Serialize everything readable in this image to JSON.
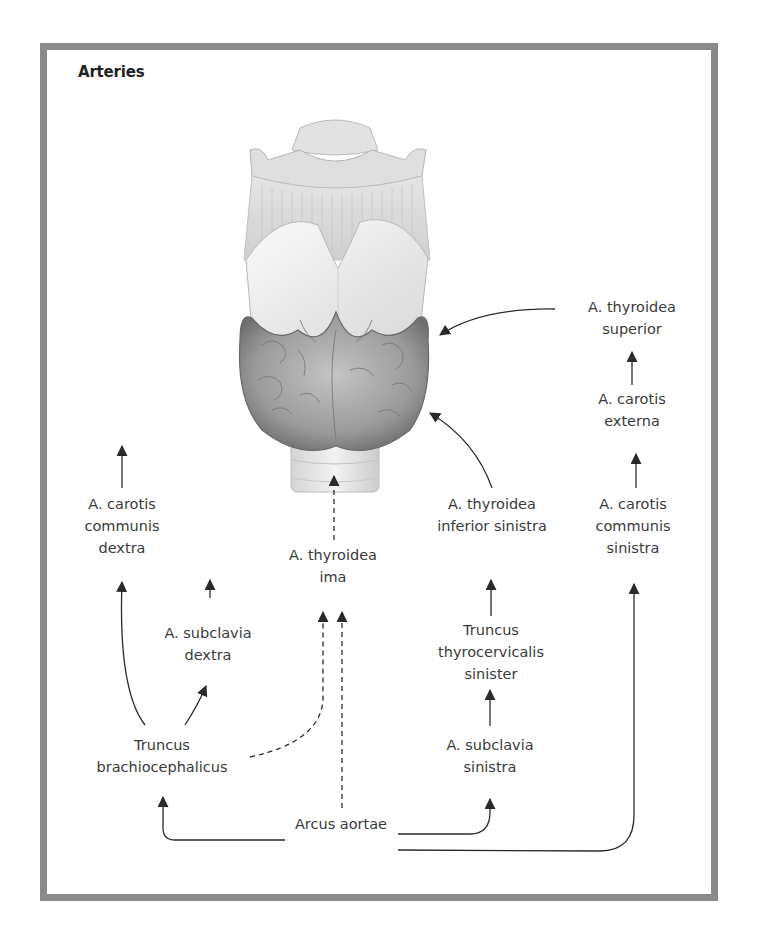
{
  "title": "Arteries",
  "colors": {
    "frame": "#8a8a8a",
    "text": "#3a3a3a",
    "arrow": "#2a2a2a",
    "thyroid_tissue": "#9a9a9a",
    "cartilage": "#e6e6e6"
  },
  "illustration": {
    "name": "larynx-and-thyroid-gland-anterior-view",
    "parts": [
      "hyoid bone",
      "thyrohyoid membrane",
      "thyroid cartilage",
      "thyroid gland",
      "trachea"
    ]
  },
  "labels": {
    "thyroidea_superior": "A. thyroidea\nsuperior",
    "carotis_externa": "A. carotis\nexterna",
    "carotis_communis_dextra": "A. carotis\ncommunis\ndextra",
    "carotis_communis_sinistra": "A. carotis\ncommunis\nsinistra",
    "thyroidea_inferior_sinistra": "A. thyroidea\ninferior sinistra",
    "thyroidea_ima": "A. thyroidea\nima",
    "subclavia_dextra": "A. subclavia\ndextra",
    "truncus_thyrocervicalis_sinister": "Truncus\nthyrocervicalis\nsinister",
    "truncus_brachiocephalicus": "Truncus\nbrachiocephalicus",
    "subclavia_sinistra": "A. subclavia\nsinistra",
    "arcus_aortae": "Arcus aortae"
  },
  "connections": [
    {
      "from": "Arcus aortae",
      "to": "Truncus brachiocephalicus",
      "style": "solid"
    },
    {
      "from": "Arcus aortae",
      "to": "A. subclavia sinistra",
      "style": "solid"
    },
    {
      "from": "Arcus aortae",
      "to": "A. carotis communis sinistra",
      "style": "solid"
    },
    {
      "from": "Arcus aortae",
      "to": "A. thyroidea ima",
      "style": "dashed"
    },
    {
      "from": "Truncus brachiocephalicus",
      "to": "A. carotis communis dextra",
      "style": "solid"
    },
    {
      "from": "Truncus brachiocephalicus",
      "to": "A. subclavia dextra",
      "style": "solid"
    },
    {
      "from": "Truncus brachiocephalicus",
      "to": "A. thyroidea ima",
      "style": "dashed"
    },
    {
      "from": "A. subclavia sinistra",
      "to": "Truncus thyrocervicalis sinister",
      "style": "solid"
    },
    {
      "from": "Truncus thyrocervicalis sinister",
      "to": "A. thyroidea inferior sinistra",
      "style": "solid"
    },
    {
      "from": "A. thyroidea inferior sinistra",
      "to": "thyroid gland",
      "style": "solid"
    },
    {
      "from": "A. carotis communis sinistra",
      "to": "A. carotis externa",
      "style": "solid"
    },
    {
      "from": "A. carotis externa",
      "to": "A. thyroidea superior",
      "style": "solid"
    },
    {
      "from": "A. thyroidea superior",
      "to": "thyroid gland",
      "style": "solid"
    },
    {
      "from": "A. thyroidea ima",
      "to": "thyroid gland",
      "style": "dashed"
    }
  ]
}
